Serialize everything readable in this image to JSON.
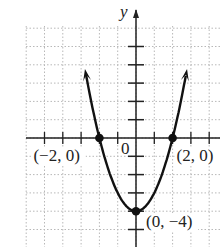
{
  "chart_data": {
    "type": "line",
    "title": "",
    "function": "y = x^2 - 4",
    "xlabel": "",
    "ylabel": "y",
    "origin_label": "0",
    "xlim": [
      -5.8,
      4.5
    ],
    "ylim": [
      -5.8,
      5.8
    ],
    "grid": true,
    "x": [
      -2.75,
      -2.5,
      -2,
      -1.5,
      -1,
      -0.5,
      0,
      0.5,
      1,
      1.5,
      2,
      2.5,
      2.75
    ],
    "y": [
      3.5625,
      2.25,
      0,
      -1.75,
      -3,
      -3.75,
      -4,
      -3.75,
      -3,
      -1.75,
      0,
      2.25,
      3.5625
    ],
    "highlighted_points": [
      {
        "x": -2,
        "y": 0,
        "label": "(−2, 0)"
      },
      {
        "x": 2,
        "y": 0,
        "label": "(2, 0)"
      },
      {
        "x": 0,
        "y": -4,
        "label": "(0, −4)"
      }
    ],
    "arrows_on_ends": true
  }
}
